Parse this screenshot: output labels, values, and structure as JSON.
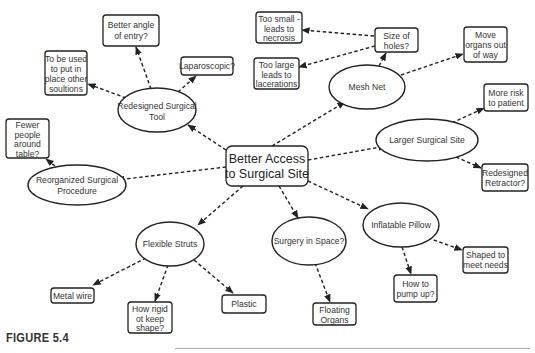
{
  "figure": {
    "caption": "FIGURE 5.4",
    "center": {
      "id": "center",
      "lines": [
        "Better Access",
        "to Surgical Site"
      ]
    },
    "nodes": [
      {
        "id": "tool",
        "shape": "ellipse",
        "lines": [
          "Redesigned Surgical",
          "Tool"
        ]
      },
      {
        "id": "angle",
        "shape": "box",
        "lines": [
          "Better angle",
          "of entry?"
        ]
      },
      {
        "id": "tobeused",
        "shape": "box",
        "lines": [
          "To be used",
          "to put in",
          "place other",
          "soultions"
        ]
      },
      {
        "id": "lap",
        "shape": "box",
        "lines": [
          "Laparoscopic?"
        ]
      },
      {
        "id": "fewer",
        "shape": "box",
        "lines": [
          "Fewer",
          "people",
          "around",
          "table?"
        ]
      },
      {
        "id": "reorg",
        "shape": "ellipse",
        "lines": [
          "Reorganized Surgical",
          "Procedure"
        ]
      },
      {
        "id": "toosmall",
        "shape": "box",
        "lines": [
          "Too small -",
          "leads to",
          "necrosis"
        ]
      },
      {
        "id": "toolarge",
        "shape": "box",
        "lines": [
          "Too large",
          "leads to",
          "lacerations"
        ]
      },
      {
        "id": "holes",
        "shape": "box",
        "lines": [
          "Size of",
          "holes?"
        ]
      },
      {
        "id": "mesh",
        "shape": "ellipse",
        "lines": [
          "Mesh Net"
        ]
      },
      {
        "id": "move",
        "shape": "box",
        "lines": [
          "Move",
          "organs out",
          "of way"
        ]
      },
      {
        "id": "risk",
        "shape": "box",
        "lines": [
          "More risk",
          "to patient"
        ]
      },
      {
        "id": "larger",
        "shape": "ellipse",
        "lines": [
          "Larger Surgical Site"
        ]
      },
      {
        "id": "retractor",
        "shape": "box",
        "lines": [
          "Redesigned",
          "Retractor?"
        ]
      },
      {
        "id": "struts",
        "shape": "ellipse",
        "lines": [
          "Flexible Struts"
        ]
      },
      {
        "id": "metal",
        "shape": "box",
        "lines": [
          "Metal wire"
        ]
      },
      {
        "id": "rigid",
        "shape": "box",
        "lines": [
          "How rigid",
          "ot keep",
          "shape?"
        ]
      },
      {
        "id": "plastic",
        "shape": "box",
        "lines": [
          "Plastic"
        ]
      },
      {
        "id": "space",
        "shape": "ellipse",
        "lines": [
          "Surgery in Space?"
        ]
      },
      {
        "id": "floating",
        "shape": "box",
        "lines": [
          "Floating",
          "Organs"
        ]
      },
      {
        "id": "pillow",
        "shape": "ellipse",
        "lines": [
          "Inflatable Pillow"
        ]
      },
      {
        "id": "pump",
        "shape": "box",
        "lines": [
          "How to",
          "pump up?"
        ]
      },
      {
        "id": "shaped",
        "shape": "box",
        "lines": [
          "Shaped to",
          "meet needs"
        ]
      }
    ],
    "edges": [
      [
        "center",
        "tool"
      ],
      [
        "center",
        "reorg"
      ],
      [
        "center",
        "mesh"
      ],
      [
        "center",
        "larger"
      ],
      [
        "center",
        "struts"
      ],
      [
        "center",
        "space"
      ],
      [
        "center",
        "pillow"
      ],
      [
        "tool",
        "angle"
      ],
      [
        "tool",
        "tobeused"
      ],
      [
        "tool",
        "lap"
      ],
      [
        "reorg",
        "fewer"
      ],
      [
        "mesh",
        "holes"
      ],
      [
        "mesh",
        "move"
      ],
      [
        "holes",
        "toosmall"
      ],
      [
        "holes",
        "toolarge"
      ],
      [
        "larger",
        "risk"
      ],
      [
        "larger",
        "retractor"
      ],
      [
        "struts",
        "metal"
      ],
      [
        "struts",
        "rigid"
      ],
      [
        "struts",
        "plastic"
      ],
      [
        "space",
        "floating"
      ],
      [
        "pillow",
        "pump"
      ],
      [
        "pillow",
        "shaped"
      ]
    ]
  }
}
